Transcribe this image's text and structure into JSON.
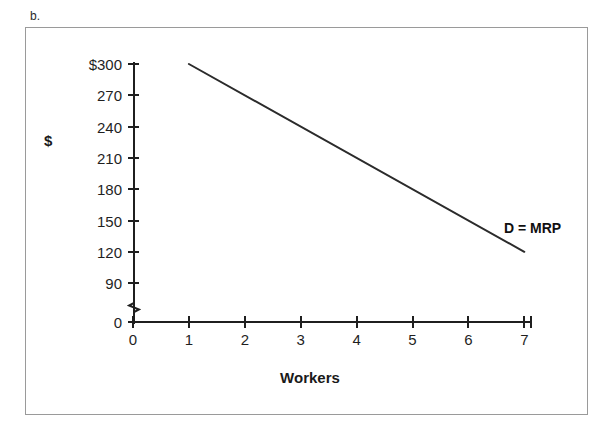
{
  "figure": {
    "label": "b."
  },
  "chart_data": {
    "type": "line",
    "title": "",
    "subtitle": "",
    "xlabel": "Workers",
    "ylabel": "$",
    "xlim": [
      0,
      7
    ],
    "ylim": [
      0,
      300
    ],
    "grid": false,
    "legend_position": "inline-right",
    "y_axis_break": true,
    "y_axis_break_between": [
      0,
      90
    ],
    "x_ticks": [
      0,
      1,
      2,
      3,
      4,
      5,
      6,
      7
    ],
    "x_tick_labels": [
      "0",
      "1",
      "2",
      "3",
      "4",
      "5",
      "6",
      "7"
    ],
    "y_ticks": [
      0,
      90,
      120,
      150,
      180,
      210,
      240,
      270,
      300
    ],
    "y_tick_labels": [
      "0",
      "90",
      "120",
      "150",
      "180",
      "210",
      "240",
      "270",
      "$300"
    ],
    "series": [
      {
        "name": "D = MRP",
        "label": "D = MRP",
        "color": "#2b2b2b",
        "x": [
          1,
          2,
          3,
          4,
          5,
          6,
          7
        ],
        "values": [
          300,
          270,
          240,
          210,
          180,
          150,
          120
        ],
        "annotation": "D = MRP"
      }
    ]
  },
  "axis": {
    "y_title": "$",
    "x_title": "Workers"
  },
  "colors": {
    "line": "#2b2b2b",
    "axis": "#1f1f1f",
    "frame": "#9a9a9a",
    "text": "#1a1a1a"
  }
}
